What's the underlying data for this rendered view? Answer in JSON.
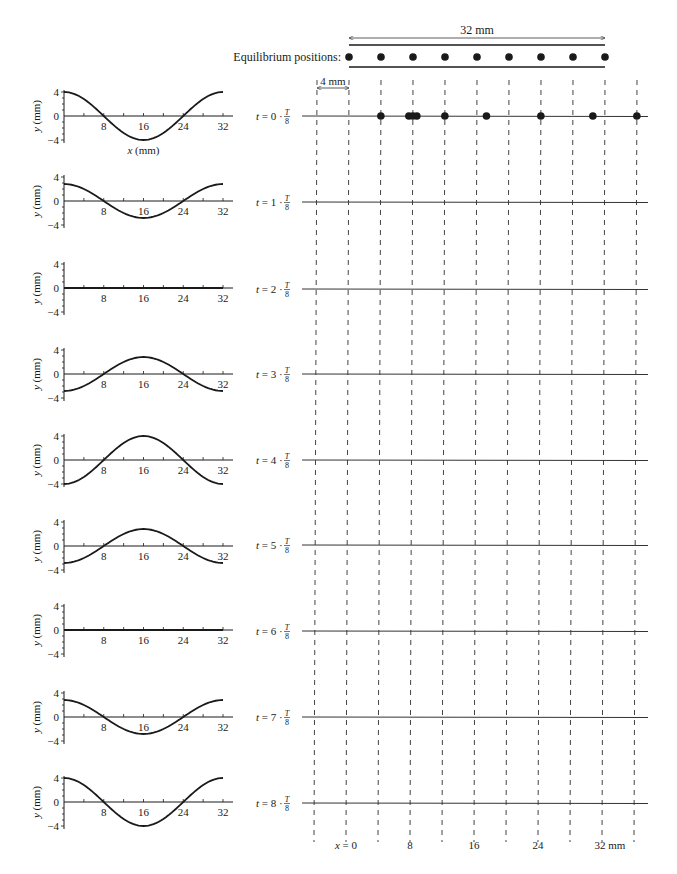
{
  "header": {
    "length_label": "32 mm",
    "equilibrium_label": "Equilibrium positions:",
    "spacing_label": "4 mm"
  },
  "bottom_axis": {
    "labels": [
      "x = 0",
      "8",
      "16",
      "24",
      "32 mm"
    ],
    "positions_mm": [
      0,
      8,
      16,
      24,
      32
    ]
  },
  "plot_axis": {
    "y_label": "y (mm)",
    "x_label": "x (mm)",
    "y_ticks": [
      "4",
      "0",
      "−4"
    ],
    "x_ticks": [
      "8",
      "16",
      "24",
      "32"
    ]
  },
  "rows": [
    {
      "t_label": "t = 0 · ",
      "n": 0,
      "amplitude_mm": 4.0
    },
    {
      "t_label": "t = 1 · ",
      "n": 1,
      "amplitude_mm": 2.83
    },
    {
      "t_label": "t = 2 · ",
      "n": 2,
      "amplitude_mm": 0.0
    },
    {
      "t_label": "t = 3 · ",
      "n": 3,
      "amplitude_mm": -2.83
    },
    {
      "t_label": "t = 4 · ",
      "n": 4,
      "amplitude_mm": -4.0
    },
    {
      "t_label": "t = 5 · ",
      "n": 5,
      "amplitude_mm": -2.83
    },
    {
      "t_label": "t = 6 · ",
      "n": 6,
      "amplitude_mm": 0.0
    },
    {
      "t_label": "t = 7 · ",
      "n": 7,
      "amplitude_mm": 2.83
    },
    {
      "t_label": "t = 8 · ",
      "n": 8,
      "amplitude_mm": 4.0
    }
  ],
  "fraction": {
    "numerator": "T",
    "denominator": "8"
  },
  "t0_displaced_dots_mm": [
    4,
    7.5,
    8,
    8.5,
    12,
    17.2,
    24,
    30.5,
    36
  ],
  "equilibrium_dots_mm": [
    0,
    4,
    8,
    12,
    16,
    20,
    24,
    28,
    32
  ],
  "dashed_lines_mm": [
    -4,
    0,
    4,
    8,
    12,
    16,
    20,
    24,
    28,
    32,
    36
  ],
  "colors": {
    "ink": "#1a1a1a",
    "rule": "#333333",
    "dash": "#444444"
  },
  "chart_data": {
    "type": "line",
    "xlabel": "x (mm)",
    "ylabel": "y (mm)",
    "xlim": [
      0,
      32
    ],
    "ylim": [
      -4,
      4
    ],
    "x_ticks": [
      8,
      16,
      24,
      32
    ],
    "y_ticks": [
      4,
      0,
      -4
    ],
    "x": [
      0,
      4,
      8,
      12,
      16,
      20,
      24,
      28,
      32
    ],
    "series": [
      {
        "name": "t = 0·T/8",
        "values": [
          4,
          2.83,
          0,
          -2.83,
          -4,
          -2.83,
          0,
          2.83,
          4
        ]
      },
      {
        "name": "t = 1·T/8",
        "values": [
          2.83,
          2,
          0,
          -2,
          -2.83,
          -2,
          0,
          2,
          2.83
        ]
      },
      {
        "name": "t = 2·T/8",
        "values": [
          0,
          0,
          0,
          0,
          0,
          0,
          0,
          0,
          0
        ]
      },
      {
        "name": "t = 3·T/8",
        "values": [
          -2.83,
          -2,
          0,
          2,
          2.83,
          2,
          0,
          -2,
          -2.83
        ]
      },
      {
        "name": "t = 4·T/8",
        "values": [
          -4,
          -2.83,
          0,
          2.83,
          4,
          2.83,
          0,
          -2.83,
          -4
        ]
      },
      {
        "name": "t = 5·T/8",
        "values": [
          -2.83,
          -2,
          0,
          2,
          2.83,
          2,
          0,
          -2,
          -2.83
        ]
      },
      {
        "name": "t = 6·T/8",
        "values": [
          0,
          0,
          0,
          0,
          0,
          0,
          0,
          0,
          0
        ]
      },
      {
        "name": "t = 7·T/8",
        "values": [
          2.83,
          2,
          0,
          -2,
          -2.83,
          -2,
          0,
          2,
          2.83
        ]
      },
      {
        "name": "t = 8·T/8",
        "values": [
          4,
          2.83,
          0,
          -2.83,
          -4,
          -2.83,
          0,
          2.83,
          4
        ]
      }
    ],
    "grid": false,
    "legend": "none"
  }
}
